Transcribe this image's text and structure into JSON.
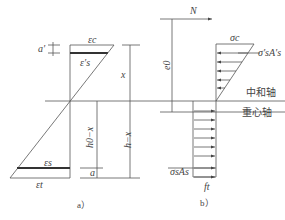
{
  "diagram": {
    "panel_a": {
      "caption": "a）",
      "labels": {
        "eps_c": "εc",
        "eps_s_prime": "ε′s",
        "eps_s": "εs",
        "eps_t": "εt",
        "a_prime": "a′",
        "x": "x",
        "h0_minus_x": "h0−x",
        "h_minus_x": "h−x",
        "a": "a"
      }
    },
    "panel_b": {
      "caption": "b）",
      "labels": {
        "N": "N",
        "e0": "e0",
        "sigma_c": "σc",
        "sigma_s_prime_As_prime": "σ′sA′s",
        "neutral_axis": "中和轴",
        "centroid_axis": "重心轴",
        "sigma_s_As": "σsAs",
        "ft": "ft"
      }
    },
    "colors": {
      "line": "#555555",
      "text": "#444444"
    }
  }
}
